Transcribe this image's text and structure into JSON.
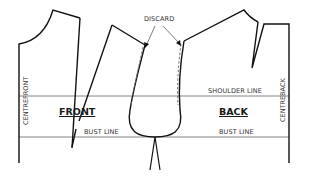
{
  "diagram": {
    "title_labels": {
      "discard": "DISCARD",
      "front": "FRONT",
      "back": "BACK",
      "shoulder_line": "SHOULDER LINE",
      "bust_line_front": "BUST LINE",
      "bust_line_back": "BUST LINE",
      "centre_front": "CENTREFRONT",
      "centre_back": "CENTREBACK"
    },
    "colors": {
      "outline": "#111111",
      "guide_line": "#555555",
      "dashed": "#666666",
      "text": "#333333"
    },
    "pieces": [
      {
        "name": "front bodice",
        "label": "FRONT"
      },
      {
        "name": "back bodice",
        "label": "BACK"
      }
    ],
    "annotations": [
      {
        "text": "DISCARD",
        "points_to": [
          "front armhole seam allowance",
          "back armhole seam allowance"
        ]
      }
    ]
  }
}
